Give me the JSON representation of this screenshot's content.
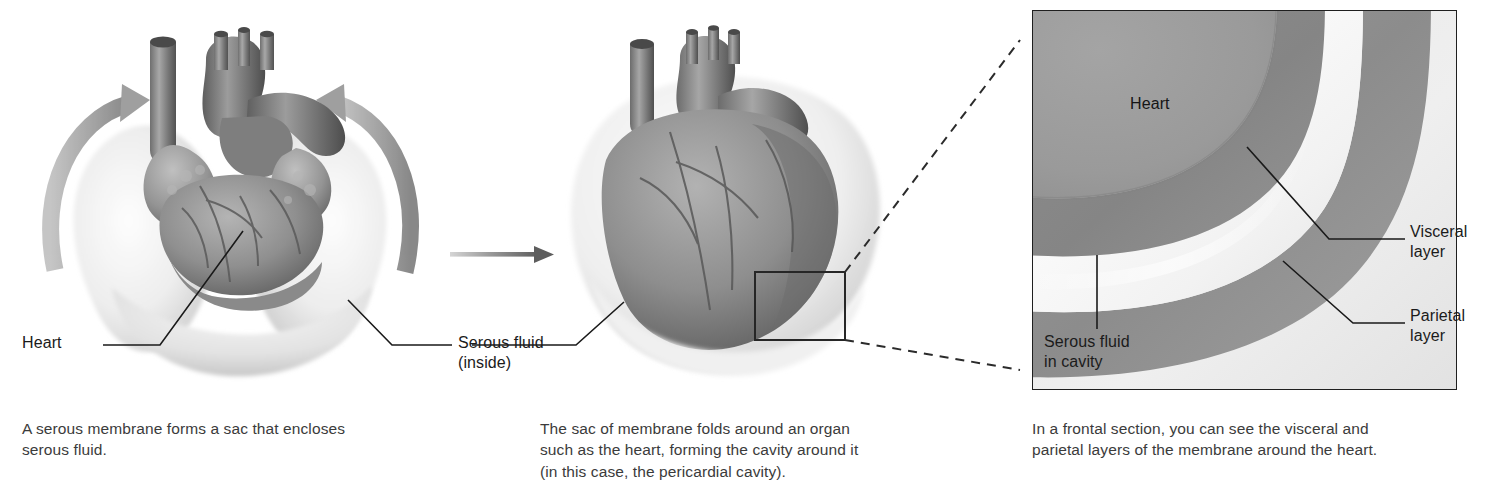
{
  "figure": {
    "background_color": "#ffffff",
    "text_color": "#3b3b3b",
    "label_color": "#1b1b1b"
  },
  "panels": [
    {
      "id": "panel-open-sac",
      "caption": "A serous membrane forms a sac that encloses\nserous fluid.",
      "labels": [
        {
          "name": "heart",
          "text": "Heart"
        },
        {
          "name": "serous-fluid",
          "text": "Serous fluid\n(inside)"
        }
      ],
      "artwork": {
        "name": "heart-in-open-serous-sac",
        "description": "Heart resting inside an open serous membrane sac with curved arrows showing the sac folding around it"
      },
      "arrows": [
        {
          "name": "fold-arrow-left",
          "direction": "curve-up-right"
        },
        {
          "name": "fold-arrow-right",
          "direction": "curve-up-left"
        }
      ]
    },
    {
      "id": "panel-closed-sac",
      "caption": "The sac of membrane folds around an organ\nsuch as the heart, forming the cavity around it\n(in this case, the pericardial cavity).",
      "labels": [],
      "artwork": {
        "name": "heart-enclosed-in-serous-sac",
        "description": "Heart fully enclosed by the folded serous membrane sac"
      },
      "callout_box": {
        "name": "magnification-source-box",
        "shape": "rectangle"
      }
    },
    {
      "id": "panel-frontal-section",
      "caption": "In a frontal section, you can see the visceral and\nparietal layers of the membrane around the heart.",
      "labels": [
        {
          "name": "heart",
          "text": "Heart"
        },
        {
          "name": "visceral-layer",
          "text": "Visceral\nlayer"
        },
        {
          "name": "parietal-layer",
          "text": "Parietal\nlayer"
        },
        {
          "name": "serous-fluid-in-cavity",
          "text": "Serous fluid\nin cavity"
        }
      ],
      "artwork": {
        "name": "frontal-section-magnified-inset",
        "description": "Magnified frontal section showing heart wall, visceral layer, serous fluid cavity and parietal layer"
      }
    }
  ],
  "connectors": [
    {
      "name": "transition-arrow",
      "style": "solid-gradient-arrow",
      "from": "panel-open-sac",
      "to": "panel-closed-sac"
    },
    {
      "name": "magnification-leader-top",
      "style": "dashed",
      "from": "magnification-source-box",
      "to": "inset-top-left"
    },
    {
      "name": "magnification-leader-bottom",
      "style": "dashed",
      "from": "magnification-source-box",
      "to": "inset-bottom-left"
    }
  ],
  "colors": {
    "heart_fill": "#9a9a9a",
    "visceral_layer": "#8d8d8d",
    "serous_fluid": "#f3f3f1",
    "parietal_layer": "#8d8d8d",
    "inset_outer": "#e6e6e6",
    "inset_border": "#1f1f1f",
    "line": "#1a1a1a",
    "arrow_grey": "#8c8c8c"
  }
}
